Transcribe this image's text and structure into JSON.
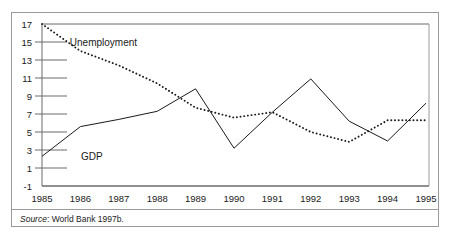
{
  "figure": {
    "border_color": "#9a9a9a",
    "background": "#ffffff"
  },
  "source": {
    "prefix": "Source",
    "separator": ":",
    "text": "World Bank 1997b."
  },
  "chart_data": {
    "type": "line",
    "title": "",
    "xlabel": "",
    "ylabel": "",
    "categories": [
      "1985",
      "1986",
      "1987",
      "1988",
      "1989",
      "1990",
      "1991",
      "1992",
      "1993",
      "1994",
      "1995"
    ],
    "x": [
      1985,
      1986,
      1987,
      1988,
      1989,
      1990,
      1991,
      1992,
      1993,
      1994,
      1995
    ],
    "ylim": [
      -1,
      17
    ],
    "yticks": [
      17,
      15,
      13,
      11,
      9,
      7,
      5,
      3,
      1,
      -1
    ],
    "ytick_labels": [
      "17",
      "15",
      "13",
      "11",
      "9",
      "7",
      "5",
      "3",
      "1",
      "-1"
    ],
    "xtick_labels": [
      "1985",
      "1986",
      "1987",
      "1988",
      "1989",
      "1990",
      "1991",
      "1992",
      "1993",
      "1994",
      "1995"
    ],
    "grid": "horizontal-left-stubs",
    "legend": "inline-annotations",
    "series": [
      {
        "name": "Unemployment",
        "style": "dotted",
        "color": "#1a1a1a",
        "label_x": 1986.6,
        "label_y": 14.6,
        "values": [
          17.0,
          14.0,
          12.4,
          10.4,
          7.7,
          6.6,
          7.2,
          5.0,
          3.9,
          6.3,
          6.3
        ]
      },
      {
        "name": "GDP",
        "style": "solid",
        "color": "#1a1a1a",
        "label_x": 1986.3,
        "label_y": 1.9,
        "values": [
          2.3,
          5.6,
          6.4,
          7.3,
          9.8,
          3.2,
          7.2,
          10.9,
          6.2,
          4.0,
          8.2
        ]
      }
    ]
  }
}
